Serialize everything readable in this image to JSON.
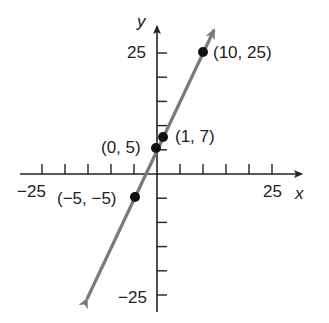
{
  "chart_data": {
    "type": "line",
    "title": "",
    "xlabel": "x",
    "ylabel": "y",
    "xlim": [
      -25,
      25
    ],
    "ylim": [
      -25,
      25
    ],
    "x_tick_step": 5,
    "y_tick_step": 5,
    "x_tick_labels": [
      "-25",
      "25"
    ],
    "y_tick_labels": [
      "25",
      "-25"
    ],
    "grid": false,
    "line": {
      "equation": "y = 2x + 5",
      "slope": 2,
      "intercept": 5,
      "color": "#7a7a7a",
      "arrows_both_ends": true
    },
    "points": [
      {
        "x": 10,
        "y": 25,
        "label": "(10, 25)"
      },
      {
        "x": 1,
        "y": 7,
        "label": "(1, 7)"
      },
      {
        "x": 0,
        "y": 5,
        "label": "(0, 5)"
      },
      {
        "x": -5,
        "y": -5,
        "label": "(−5, −5)"
      }
    ]
  },
  "labels": {
    "x_axis": "x",
    "y_axis": "y",
    "x_min": "−25",
    "x_max": "25",
    "y_max": "25",
    "y_min": "−25",
    "p1": "(10, 25)",
    "p2": "(1, 7)",
    "p3": "(0, 5)",
    "p4": "(−5, −5)"
  }
}
